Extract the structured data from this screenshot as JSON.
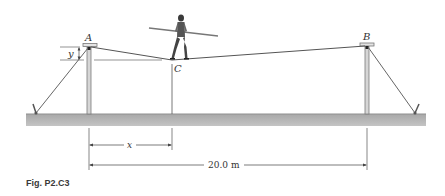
{
  "figure": {
    "caption": "Fig. P2.C3",
    "labels": {
      "point_a": "A",
      "point_b": "B",
      "point_c": "C",
      "sag": "y",
      "horizontal_offset": "x",
      "span": "20.0 m"
    },
    "colors": {
      "ground": "#b5b5b5",
      "ground_shade": "#9c9c9c",
      "cable": "#555555",
      "pole": "#8a8a8a",
      "text": "#333333"
    }
  }
}
